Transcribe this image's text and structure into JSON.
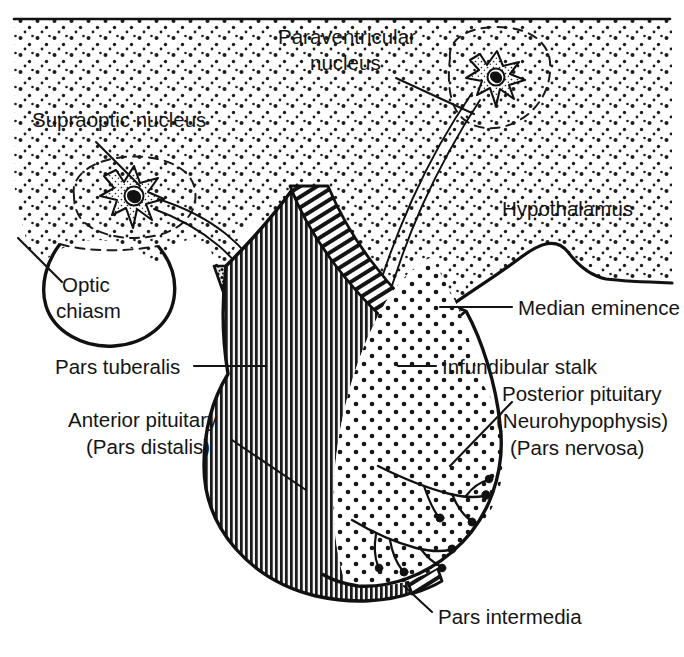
{
  "figure": {
    "width": 684,
    "height": 657,
    "background_color": "#ffffff",
    "ink_color": "#141414"
  },
  "labels": {
    "paraventricular_nucleus_line1": "Paraventricular",
    "paraventricular_nucleus_line2": "nucleus",
    "supraoptic_nucleus": "Supraoptic nucleus",
    "hypothalamus": "Hypothalamus",
    "optic_chiasm_line1": "Optic",
    "optic_chiasm_line2": "chiasm",
    "median_eminence": "Median eminence",
    "pars_tuberalis": "Pars tuberalis",
    "infundibular_stalk": "Infundibular stalk",
    "posterior_pituitary_line1": "Posterior pituitary",
    "posterior_pituitary_line2": "(Neurohypophysis)",
    "posterior_pituitary_line3": "(Pars nervosa)",
    "anterior_pituitary_line1": "Anterior pituitary",
    "anterior_pituitary_line2": "(Pars distalis)",
    "pars_intermedia": "Pars intermedia"
  },
  "structures": {
    "hypothalamus": {
      "name": "hypothalamus",
      "fill_pattern": "stipple",
      "description": "Large stippled region occupying the upper portion of the figure"
    },
    "paraventricular_nucleus": {
      "name": "paraventricular-nucleus",
      "outline": "dashed",
      "contains": "magnocellular neuron"
    },
    "supraoptic_nucleus": {
      "name": "supraoptic-nucleus",
      "outline": "dashed",
      "contains": "magnocellular neuron"
    },
    "optic_chiasm": {
      "name": "optic-chiasm",
      "outline": "solid",
      "fill_pattern": "none"
    },
    "infundibular_stalk": {
      "name": "infundibular-stalk",
      "fill_pattern": "stipple"
    },
    "median_eminence": {
      "name": "median-eminence",
      "fill_pattern": "granular"
    },
    "pars_tuberalis": {
      "name": "pars-tuberalis",
      "fill_pattern": "granular-dark-band"
    },
    "anterior_pituitary": {
      "name": "anterior-pituitary",
      "fill_pattern": "dense-vertical-hatch"
    },
    "pars_intermedia": {
      "name": "pars-intermedia",
      "fill_pattern": "diagonal-hatch-band"
    },
    "posterior_pituitary": {
      "name": "posterior-pituitary",
      "fill_pattern": "coarse-stipple",
      "contains": "branching axon terminals"
    }
  }
}
